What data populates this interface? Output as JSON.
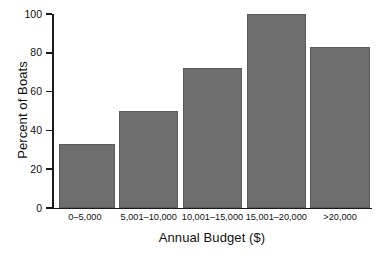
{
  "chart_data": {
    "type": "bar",
    "title": "",
    "xlabel": "Annual Budget ($)",
    "ylabel": "Percent of Boats",
    "categories": [
      "0–5,000",
      "5,001–10,000",
      "10,001–15,000",
      "15,001–20,000",
      ">20,000"
    ],
    "values": [
      33,
      50,
      72,
      100,
      83
    ],
    "ylim": [
      0,
      100
    ],
    "yticks": [
      0,
      20,
      40,
      60,
      80,
      100
    ],
    "ytick_labels": [
      "0",
      "20",
      "40",
      "60",
      "80",
      "100"
    ],
    "grid": false,
    "legend": null,
    "bar_color": "#6e6e6e",
    "axis_color": "#1a1a1a",
    "background": "#ffffff"
  },
  "axes": {
    "y_title": "Percent of Boats",
    "x_title": "Annual Budget ($)"
  }
}
